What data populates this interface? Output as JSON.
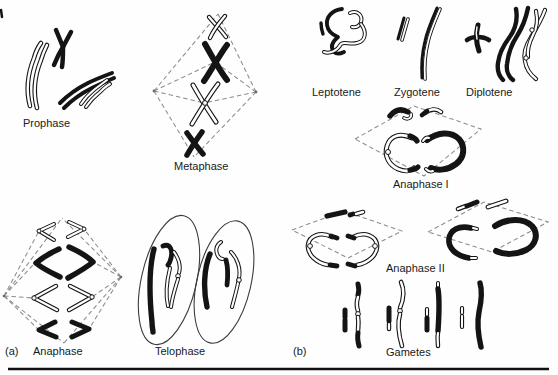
{
  "figure": {
    "labels": {
      "prophase": "Prophase",
      "metaphase": "Metaphase",
      "panel_a": "(a)",
      "anaphase": "Anaphase",
      "telophase": "Telophase",
      "leptotene": "Leptotene",
      "zygotene": "Zygotene",
      "diplotene": "Diplotene",
      "anaphase_i": "Anaphase I",
      "anaphase_ii": "Anaphase II",
      "panel_b": "(b)",
      "gametes": "Gametes"
    },
    "colors": {
      "ink": "#141414",
      "paper": "#ffffff",
      "spindle_dash": "#8c8c8c"
    }
  }
}
